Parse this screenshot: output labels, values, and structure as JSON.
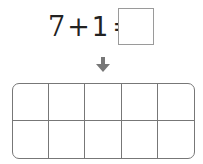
{
  "equation": {
    "left_operand": "7",
    "operator": "+",
    "right_operand": "1",
    "equals": "=",
    "answer": ""
  },
  "arrow": {
    "icon": "down-arrow-icon",
    "color": "#777777"
  },
  "ten_frame": {
    "rows": 2,
    "columns": 5,
    "cells": [
      "",
      "",
      "",
      "",
      "",
      "",
      "",
      "",
      "",
      ""
    ],
    "border_color": "#777777"
  }
}
